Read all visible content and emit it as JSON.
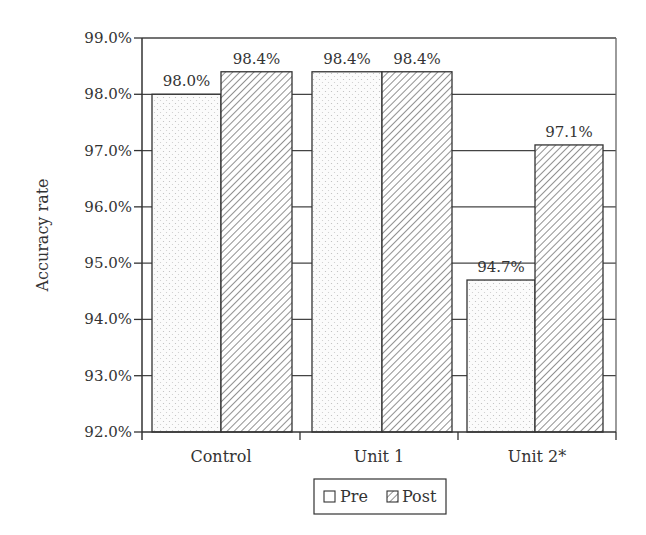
{
  "chart_data": {
    "type": "bar",
    "title": "",
    "xlabel": "",
    "ylabel": "Accuracy rate",
    "ylim": [
      92.0,
      99.0
    ],
    "yticks": [
      "92.0%",
      "93.0%",
      "94.0%",
      "95.0%",
      "96.0%",
      "97.0%",
      "98.0%",
      "99.0%"
    ],
    "grid": true,
    "legend_position": "bottom",
    "categories": [
      "Control",
      "Unit 1",
      "Unit 2*"
    ],
    "series": [
      {
        "name": "Pre",
        "pattern": "dots",
        "values": [
          98.0,
          98.4,
          94.7
        ],
        "labels": [
          "98.0%",
          "98.4%",
          "94.7%"
        ]
      },
      {
        "name": "Post",
        "pattern": "diagonal-hatch",
        "values": [
          98.4,
          98.4,
          97.1
        ],
        "labels": [
          "98.4%",
          "98.4%",
          "97.1%"
        ]
      }
    ]
  },
  "colors": {
    "axis": "#333333",
    "grid": "#444444",
    "bar_stroke": "#333333",
    "background": "#ffffff"
  }
}
